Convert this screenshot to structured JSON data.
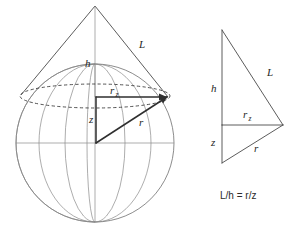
{
  "figure": {
    "background_color": "#ffffff",
    "line_color": "#555555",
    "heavy_line_color": "#3a3a3a",
    "dashed_line_color": "#444444",
    "text_color": "#262626"
  },
  "left_diagram": {
    "name": "sphere-with-cone",
    "sphere": {
      "center_x": 95,
      "center_y": 143,
      "radius": 79,
      "meridian_count": 5,
      "equator_label": ""
    },
    "cone": {
      "apex_x": 95,
      "apex_y": 6,
      "base_left_x": 21,
      "base_left_y": 95,
      "base_right_x": 168,
      "base_right_y": 97
    },
    "cap_ellipse": {
      "center_x": 95,
      "center_y": 96,
      "rx": 75,
      "ry": 12,
      "style": "dashed"
    },
    "labels": [
      {
        "id": "label-h-left",
        "text": "h",
        "x": 85,
        "y": 67
      },
      {
        "id": "label-L-left",
        "text": "L",
        "x": 139,
        "y": 48
      },
      {
        "id": "label-rz-left",
        "text": "r",
        "sub": "z",
        "x": 110,
        "y": 94
      },
      {
        "id": "label-z-left",
        "text": "z",
        "x": 89,
        "y": 123
      },
      {
        "id": "label-r-left",
        "text": "r",
        "x": 139,
        "y": 126
      }
    ]
  },
  "right_diagram": {
    "name": "similar-triangles",
    "triangle": {
      "apex_x": 222,
      "apex_y": 30,
      "bottom_x": 222,
      "bottom_y": 163,
      "right_x": 283,
      "right_y": 125,
      "mid_x": 222,
      "mid_y": 125
    },
    "labels": [
      {
        "id": "label-h-right",
        "text": "h",
        "x": 211,
        "y": 92
      },
      {
        "id": "label-L-right",
        "text": "L",
        "x": 267,
        "y": 76
      },
      {
        "id": "label-rz-right",
        "text": "r",
        "sub": "z",
        "x": 243,
        "y": 118
      },
      {
        "id": "label-z-right",
        "text": "z",
        "x": 211,
        "y": 146
      },
      {
        "id": "label-r-right",
        "text": "r",
        "x": 254,
        "y": 152
      }
    ],
    "equation": {
      "text": "L/h = r/z",
      "x": 220,
      "y": 199
    }
  }
}
